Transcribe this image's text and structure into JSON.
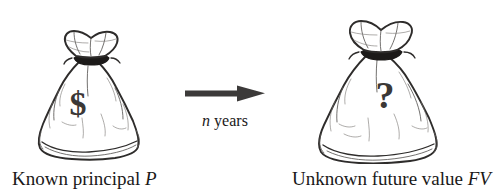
{
  "figure": {
    "type": "diagram",
    "topic": "time-value-of-money",
    "background_color": "#ffffff",
    "ink_color": "#2e2c2b"
  },
  "left": {
    "icon": "money-bag-icon",
    "bag_mark": "$",
    "caption_prefix": "Known principal ",
    "caption_symbol": "P",
    "caption_full": "Known principal P"
  },
  "arrow": {
    "icon": "arrow-right-icon",
    "color": "#3c3a39",
    "label_symbol": "n",
    "label_suffix": " years",
    "label_full": "n years"
  },
  "right": {
    "icon": "money-bag-icon",
    "bag_mark": "?",
    "caption_prefix": "Unknown future value ",
    "caption_symbol": "FV",
    "caption_full": "Unknown future value FV"
  }
}
